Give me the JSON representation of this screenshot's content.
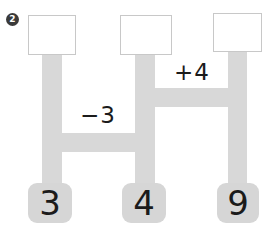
{
  "figure": {
    "problem_number": "2",
    "columns": [
      {
        "bottom_value": "3",
        "top_value": ""
      },
      {
        "bottom_value": "4",
        "top_value": ""
      },
      {
        "bottom_value": "9",
        "top_value": ""
      }
    ],
    "connections": [
      {
        "operation": "−3"
      },
      {
        "operation": "+4"
      }
    ]
  },
  "colors": {
    "pipe": "#d8d8d8",
    "tile": "#d6d6d6",
    "top_box_border": "#c8c8c8",
    "badge_bg": "#3a3a3a",
    "ink": "#1b1b1b"
  }
}
